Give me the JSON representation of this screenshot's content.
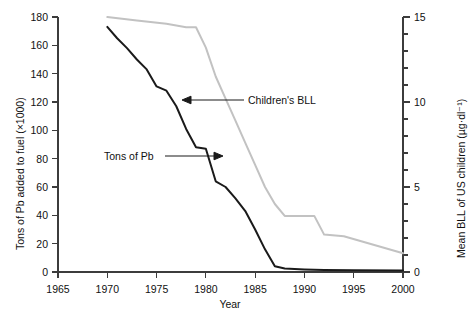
{
  "chart_data": {
    "type": "line",
    "title": "",
    "xlabel": "Year",
    "ylabel_left": "Tons of Pb added to fuel (×1000)",
    "ylabel_right": "Mean BLL of US children (µg·dl⁻¹)",
    "xlim": [
      1965,
      2000
    ],
    "ylim_left": [
      0,
      180
    ],
    "ylim_right": [
      0,
      15
    ],
    "grid": false,
    "legend": "none",
    "x_ticks": [
      1965,
      1970,
      1975,
      1980,
      1985,
      1990,
      1995,
      2000
    ],
    "x_tick_labels": [
      "1965",
      "1970",
      "1975",
      "1980",
      "1985",
      "1990",
      "1995",
      "2000"
    ],
    "y_ticks_left": [
      0,
      20,
      40,
      60,
      80,
      100,
      120,
      140,
      160,
      180
    ],
    "y_tick_labels_left": [
      "0",
      "20",
      "40",
      "60",
      "80",
      "100",
      "120",
      "140",
      "160",
      "180"
    ],
    "y_ticks_right": [
      0,
      5,
      10,
      15
    ],
    "y_tick_labels_right": [
      "0",
      "5",
      "10",
      "15"
    ],
    "y_minor_ticks_right": [
      1,
      2,
      3,
      4,
      6,
      7,
      8,
      9,
      11,
      12,
      13,
      14
    ],
    "series": [
      {
        "name": "Tons of Pb",
        "axis": "left",
        "color": "#1a1a1a",
        "line_width": 2.0,
        "x": [
          1970,
          1971,
          1972,
          1973,
          1974,
          1975,
          1976,
          1977,
          1978,
          1979,
          1980,
          1981,
          1982,
          1983,
          1984,
          1985,
          1986,
          1987,
          1988,
          1990,
          1992,
          1995,
          2000
        ],
        "values": [
          173,
          165,
          158,
          150,
          143,
          131,
          128,
          117,
          101,
          88,
          87,
          64,
          60,
          52,
          43,
          30,
          16,
          4,
          2.5,
          1.8,
          1.4,
          1.2,
          1.0
        ]
      },
      {
        "name": "Children's BLL",
        "axis": "right",
        "color": "#c2c2c2",
        "line_width": 2.0,
        "x": [
          1970,
          1973,
          1976,
          1978,
          1979,
          1980,
          1981,
          1982,
          1983,
          1984,
          1985,
          1986,
          1987,
          1988,
          1991,
          1992,
          1994,
          2000
        ],
        "values": [
          15.0,
          14.8,
          14.6,
          14.4,
          14.4,
          13.2,
          11.5,
          10.2,
          8.9,
          7.6,
          6.3,
          5.0,
          4.0,
          3.3,
          3.3,
          2.2,
          2.1,
          1.1
        ]
      }
    ],
    "annotations": [
      {
        "name": "childrens-bll-annotation",
        "text": "Children's BLL",
        "arrow": "left",
        "label_x": 248,
        "label_y": 94,
        "arrow_from_x": 244,
        "arrow_to_x": 183,
        "arrow_y": 100
      },
      {
        "name": "tons-of-pb-annotation",
        "text": "Tons of Pb",
        "arrow": "right",
        "label_x": 104,
        "label_y": 150,
        "arrow_from_x": 165,
        "arrow_to_x": 222,
        "arrow_y": 156
      }
    ]
  }
}
